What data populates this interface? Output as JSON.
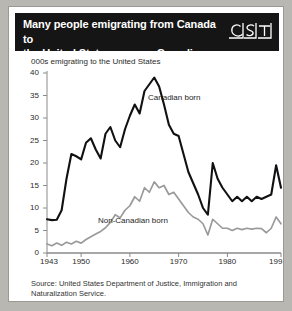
{
  "title": {
    "line1": "Many people emigrating from Canada to",
    "line2": "the United States are non-Canadian born",
    "full": "Many people emigrating from Canada to the United States are non-Canadian born"
  },
  "logo": {
    "text": "CST",
    "name": "cst-logo"
  },
  "source": "Source: United States Department of Justice, Immigration and Naturalization Service.",
  "colors": {
    "title_bar": "#151515",
    "title_text": "#ffffff",
    "page_background": "#b9b7b2",
    "figure_background": "#ffffff",
    "canadian_born": "#111111",
    "non_canadian_born": "#9a9a9a",
    "axis": "#8a8a8a",
    "text": "#2b2b2b"
  },
  "chart_data": {
    "type": "line",
    "title": "Many people emigrating from Canada to the United States are non-Canadian born",
    "subtitle": "000s emigrating to the United States",
    "xlabel": "",
    "ylabel": "000s emigrating to the United States",
    "xlim": [
      1943,
      1991
    ],
    "ylim": [
      0,
      40
    ],
    "yticks": [
      0,
      5,
      10,
      15,
      20,
      25,
      30,
      35,
      40
    ],
    "xticks": [
      1943,
      1950,
      1960,
      1970,
      1980,
      1991
    ],
    "xtick_labels": [
      "1943",
      "1950",
      "1960",
      "1970",
      "1980",
      "1991"
    ],
    "ytick_labels": [
      "0",
      "5",
      "10",
      "15",
      "20",
      "25",
      "30",
      "35",
      "40"
    ],
    "grid": false,
    "legend": "inline-annotations",
    "x": [
      1943,
      1944,
      1945,
      1946,
      1947,
      1948,
      1949,
      1950,
      1951,
      1952,
      1953,
      1954,
      1955,
      1956,
      1957,
      1958,
      1959,
      1960,
      1961,
      1962,
      1963,
      1964,
      1965,
      1966,
      1967,
      1968,
      1969,
      1970,
      1971,
      1972,
      1973,
      1974,
      1975,
      1976,
      1977,
      1978,
      1979,
      1980,
      1981,
      1982,
      1983,
      1984,
      1985,
      1986,
      1987,
      1988,
      1989,
      1990,
      1991
    ],
    "series": [
      {
        "name": "Canadian born",
        "color": "#111111",
        "label_x": 1964,
        "label_y": 35,
        "values": [
          7.5,
          7.3,
          7.4,
          9.5,
          16.5,
          22.0,
          21.5,
          20.8,
          24.5,
          25.5,
          23.0,
          21.0,
          26.5,
          28.0,
          25.0,
          23.5,
          27.5,
          30.5,
          33.0,
          31.0,
          36.0,
          37.5,
          39.0,
          37.0,
          33.0,
          28.5,
          26.5,
          26.0,
          22.0,
          18.0,
          15.5,
          13.0,
          10.0,
          8.5,
          20.0,
          16.5,
          14.5,
          13.0,
          11.5,
          12.5,
          11.5,
          12.5,
          11.5,
          12.5,
          12.0,
          12.5,
          13.0,
          19.5,
          14.5
        ]
      },
      {
        "name": "Non-Canadian born",
        "color": "#9a9a9a",
        "label_x": 1955,
        "label_y": 8,
        "values": [
          2.0,
          1.6,
          2.2,
          1.7,
          2.4,
          2.0,
          2.6,
          2.2,
          3.0,
          3.6,
          4.2,
          4.8,
          5.6,
          6.8,
          8.5,
          7.8,
          9.5,
          10.5,
          12.5,
          11.5,
          14.5,
          13.5,
          15.8,
          14.5,
          15.0,
          13.0,
          13.5,
          12.0,
          10.5,
          9.0,
          8.0,
          7.5,
          6.5,
          4.0,
          7.5,
          6.5,
          5.5,
          5.5,
          5.0,
          5.5,
          5.2,
          5.5,
          5.3,
          5.5,
          5.4,
          4.5,
          5.5,
          8.0,
          6.5
        ]
      }
    ]
  }
}
